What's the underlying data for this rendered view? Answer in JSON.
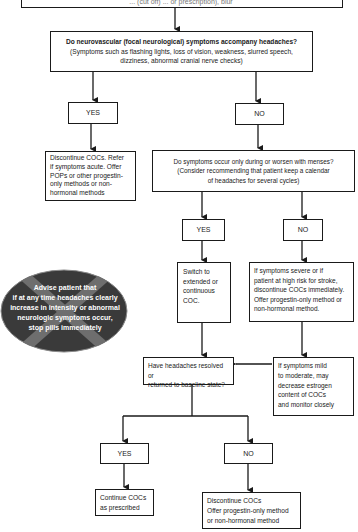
{
  "diagram": {
    "top_box_text": "... (cut off) ... or prescription), blur",
    "question_neuro": {
      "title": "Do neurovascular (focal neurological) symptoms accompany headaches?",
      "line2": "(Symptoms such as flashing lights, loss of vision, weakness, slurred speech,",
      "line3": "dizziness, abnormal cranial nerve checks)"
    },
    "yes_label": "YES",
    "no_label": "NO",
    "discontinue_refer": [
      "Discontinue COCs. Refer",
      "if symptoms acute. Offer",
      "POPs or other progestin-",
      "only methods or non-",
      "hormonal methods"
    ],
    "question_menses": {
      "title": "Do symptoms occur only during or worsen with menses?",
      "line2": "(Consider recommending that patient keep a calendar",
      "line3": "of headaches for several cycles)"
    },
    "switch_box": [
      "Switch to",
      "extended or",
      "continuous",
      "COC."
    ],
    "severe_box": [
      "If symptoms severe or if",
      "patient at high risk for stroke,",
      "discontinue COCs immediately.",
      "Offer progestin-only method or",
      "non-hormonal method."
    ],
    "advise_oval": [
      "Advise patient that",
      "if at any time headaches clearly",
      "increase in intensity or abnormal",
      "neurologic symptoms occur,",
      "stop pills immediately"
    ],
    "question_resolved": [
      "Have headaches resolved or",
      "returned to baseline state?"
    ],
    "mild_box": [
      "If symptoms mild",
      "to moderate, may",
      "decrease estrogen",
      "content of COCs",
      "and monitor closely"
    ],
    "continue_box": [
      "Continue COCs",
      "as prescribed"
    ],
    "discontinue_final": [
      "Discontinue COCs",
      "Offer progestin-only method",
      "or non-hormonal method"
    ]
  },
  "colors": {
    "line": "#1a1a1a",
    "oval_fill": "#3a3a3a",
    "oval_cross": "#6e6e6e",
    "oval_text": "#ffffff"
  }
}
